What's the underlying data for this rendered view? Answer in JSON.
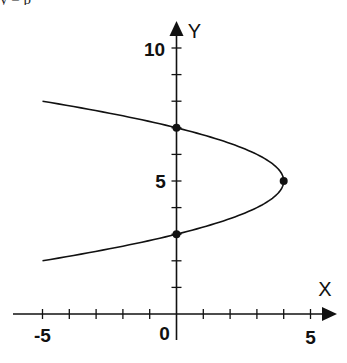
{
  "chart_data": {
    "type": "line",
    "title": "",
    "xlabel": "X",
    "ylabel": "Y",
    "xlim": [
      -5,
      5
    ],
    "ylim": [
      0,
      10
    ],
    "grid": false,
    "x_tick_labels": [
      "-5",
      "0",
      "5"
    ],
    "y_tick_labels": [
      "5",
      "10"
    ],
    "x_ticks": [
      -5,
      -4,
      -3,
      -2,
      -1,
      0,
      1,
      2,
      3,
      4,
      5
    ],
    "y_ticks": [
      1,
      2,
      3,
      4,
      5,
      6,
      7,
      8,
      9,
      10
    ],
    "series": [
      {
        "name": "parabola x = -(y-5)^2 + 4",
        "equation": "x = -(y - 5)^2 + 4",
        "y_range": [
          2,
          8
        ],
        "points": [
          {
            "x": -5,
            "y": 8
          },
          {
            "x": -2.25,
            "y": 7.5
          },
          {
            "x": 0,
            "y": 7
          },
          {
            "x": 1.75,
            "y": 6.5
          },
          {
            "x": 3,
            "y": 6
          },
          {
            "x": 3.75,
            "y": 5.5
          },
          {
            "x": 4,
            "y": 5
          },
          {
            "x": 3.75,
            "y": 4.5
          },
          {
            "x": 3,
            "y": 4
          },
          {
            "x": 1.75,
            "y": 3.5
          },
          {
            "x": 0,
            "y": 3
          },
          {
            "x": -2.25,
            "y": 2.5
          },
          {
            "x": -5,
            "y": 2
          }
        ]
      }
    ],
    "marked_points": [
      {
        "label": "y-intercept upper",
        "x": 0,
        "y": 7
      },
      {
        "label": "vertex",
        "x": 4,
        "y": 5
      },
      {
        "label": "y-intercept lower",
        "x": 0,
        "y": 3
      }
    ],
    "origin_label": "0"
  },
  "top_fragment": "y  =  p"
}
